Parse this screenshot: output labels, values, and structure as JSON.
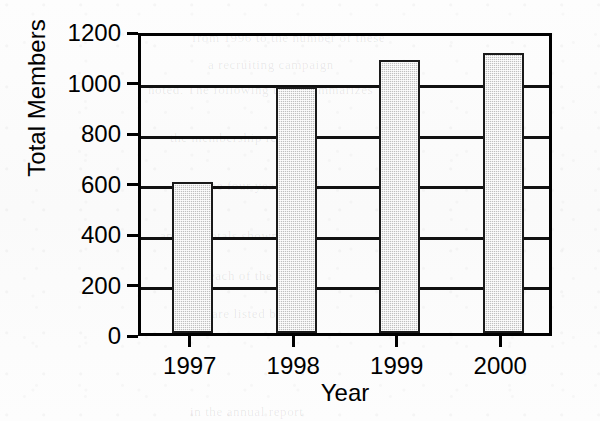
{
  "chart_data": {
    "type": "bar",
    "title": "",
    "subtitle": "",
    "xlabel": "Year",
    "ylabel": "Total Members",
    "categories": [
      "1997",
      "1998",
      "1999",
      "2000"
    ],
    "values": [
      600,
      975,
      1080,
      1110
    ],
    "series": [
      {
        "name": "Total Members",
        "values": [
          600,
          975,
          1080,
          1110
        ]
      }
    ],
    "ylim": [
      0,
      1200
    ],
    "yticks": [
      0,
      200,
      400,
      600,
      800,
      1000,
      1200
    ],
    "ytick_labels": [
      "0",
      "200",
      "400",
      "600",
      "800",
      "1000",
      "1200"
    ],
    "xtick_labels": [
      "1997",
      "1998",
      "1999",
      "2000"
    ],
    "grid": true,
    "grid_axis": "y",
    "legend": false,
    "legend_position": "none",
    "bar_fill_color": "#c0c0c0",
    "bar_edge_color": "#1a1a1a",
    "axis_color": "#000000",
    "background_color": "#ffffff",
    "annotations": []
  },
  "figure": {
    "y_axis_title": "Total Members",
    "x_axis_title": "Year"
  },
  "background_bleed": [
    {
      "text": "from 1996 to the number of these",
      "x": 192,
      "y": 30
    },
    {
      "text": "a recruiting campaign",
      "x": 208,
      "y": 57
    },
    {
      "text": "noted. The following table summarizes",
      "x": 148,
      "y": 82
    },
    {
      "text": "the membership records",
      "x": 170,
      "y": 130
    },
    {
      "text": "over the four year period",
      "x": 176,
      "y": 178
    },
    {
      "text": "and the totals shown",
      "x": 160,
      "y": 228
    },
    {
      "text": "for each of the years",
      "x": 188,
      "y": 268
    },
    {
      "text": "are listed below",
      "x": 212,
      "y": 306
    },
    {
      "text": "in the annual report",
      "x": 190,
      "y": 404
    }
  ]
}
